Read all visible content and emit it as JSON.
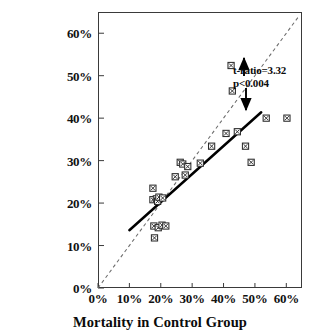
{
  "chart_data": {
    "type": "scatter",
    "title": "",
    "subtitle": "",
    "xlabel": "Mortality in Control Group",
    "ylabel": "",
    "xlim": [
      0,
      65
    ],
    "ylim": [
      0,
      65
    ],
    "grid": false,
    "legend": "none",
    "xtick_labels": [
      "0%",
      "10%",
      "20%",
      "30%",
      "40%",
      "50%",
      "60%"
    ],
    "xticks": [
      0,
      10,
      20,
      30,
      40,
      50,
      60
    ],
    "ytick_labels": [
      "0%",
      "10%",
      "20%",
      "30%",
      "40%",
      "50%",
      "60%"
    ],
    "yticks": [
      0,
      10,
      20,
      30,
      40,
      50,
      60
    ],
    "marker": "square-with-x",
    "points": [
      {
        "x": 17.5,
        "y": 23.5
      },
      {
        "x": 17.5,
        "y": 20.8
      },
      {
        "x": 18.6,
        "y": 21.0
      },
      {
        "x": 19.0,
        "y": 20.4
      },
      {
        "x": 19.4,
        "y": 21.4
      },
      {
        "x": 20.6,
        "y": 21.2
      },
      {
        "x": 17.8,
        "y": 14.6
      },
      {
        "x": 19.2,
        "y": 14.2
      },
      {
        "x": 20.4,
        "y": 14.8
      },
      {
        "x": 21.6,
        "y": 14.6
      },
      {
        "x": 18.0,
        "y": 11.8
      },
      {
        "x": 24.6,
        "y": 26.2
      },
      {
        "x": 26.2,
        "y": 29.6
      },
      {
        "x": 27.0,
        "y": 29.2
      },
      {
        "x": 27.8,
        "y": 26.6
      },
      {
        "x": 28.6,
        "y": 28.6
      },
      {
        "x": 32.6,
        "y": 29.4
      },
      {
        "x": 36.2,
        "y": 33.4
      },
      {
        "x": 40.8,
        "y": 36.4
      },
      {
        "x": 42.4,
        "y": 52.4
      },
      {
        "x": 42.8,
        "y": 46.4
      },
      {
        "x": 44.4,
        "y": 36.8
      },
      {
        "x": 47.0,
        "y": 33.4
      },
      {
        "x": 48.8,
        "y": 29.6
      },
      {
        "x": 53.6,
        "y": 40.0
      },
      {
        "x": 60.2,
        "y": 40.0
      }
    ],
    "reference_line": {
      "name": "line-of-identity",
      "style": "dashed",
      "from": {
        "x": 0,
        "y": 0
      },
      "to": {
        "x": 64.0,
        "y": 64.0
      }
    },
    "fit_line": {
      "name": "regression-line",
      "style": "solid",
      "from": {
        "x": 10.0,
        "y": 13.6
      },
      "to": {
        "x": 52.0,
        "y": 41.4
      }
    },
    "annotation": {
      "line1": "t-ratio=3.32",
      "line2": "p<0.004",
      "arrow_up": "↑",
      "arrow_down": "↓"
    },
    "colors": {
      "axis": "#3a3a3a",
      "marker": "#2b2b2b",
      "fit_line": "#000000",
      "reference_line": "#6b6b6b",
      "text": "#0b0b0b",
      "background": "#ffffff"
    }
  }
}
